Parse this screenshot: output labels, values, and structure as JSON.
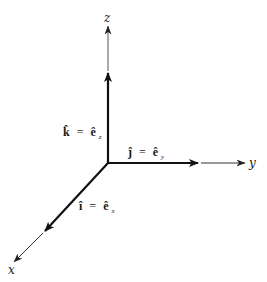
{
  "diagram": {
    "origin": {
      "x": 108,
      "y": 163
    },
    "colors": {
      "unit_vector": "#111111",
      "axis": "#333333",
      "background": "#ffffff"
    },
    "axes": [
      {
        "name": "z",
        "label": "z",
        "bold_tip": [
          108,
          73
        ],
        "thin_tip": [
          108,
          26
        ],
        "label_pos": [
          108,
          19
        ]
      },
      {
        "name": "y",
        "label": "y",
        "bold_tip": [
          198,
          163
        ],
        "thin_tip": [
          245,
          163
        ],
        "label_pos": [
          254,
          167
        ]
      },
      {
        "name": "x",
        "label": "x",
        "bold_tip": [
          45,
          231
        ],
        "thin_tip": [
          14,
          262
        ],
        "label_pos": [
          12,
          272
        ]
      }
    ],
    "vectors": [
      {
        "name": "k",
        "symbol": "k̂",
        "equals": "=",
        "basis": "ê",
        "subscript": "z",
        "label_pos": [
          63,
          136
        ]
      },
      {
        "name": "j",
        "symbol": "ĵ",
        "equals": "=",
        "basis": "ê",
        "subscript": "y",
        "label_pos": [
          127,
          156
        ]
      },
      {
        "name": "i",
        "symbol": "î",
        "equals": "=",
        "basis": "ê",
        "subscript": "x",
        "label_pos": [
          78,
          210
        ]
      }
    ]
  }
}
